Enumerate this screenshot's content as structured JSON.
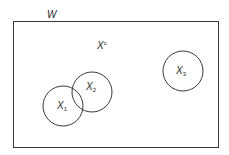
{
  "diagram": {
    "type": "venn",
    "universe": {
      "label": "W",
      "rect": {
        "x": 13,
        "y": 21,
        "width": 205,
        "height": 126
      }
    },
    "complement": {
      "base": "X",
      "sup": "c",
      "x": 97,
      "y": 41
    },
    "sets": [
      {
        "id": "X1",
        "base": "X",
        "sub": "1",
        "cx": 63,
        "cy": 106,
        "r": 20,
        "label_x": 57,
        "label_y": 101
      },
      {
        "id": "X2",
        "base": "X",
        "sub": "2",
        "cx": 92,
        "cy": 92,
        "r": 20,
        "label_x": 86,
        "label_y": 82
      },
      {
        "id": "X3",
        "base": "X",
        "sub": "3",
        "cx": 183,
        "cy": 71,
        "r": 20,
        "label_x": 176,
        "label_y": 66
      }
    ],
    "stroke_color": "#3a3a3a",
    "background_color": "#ffffff"
  }
}
